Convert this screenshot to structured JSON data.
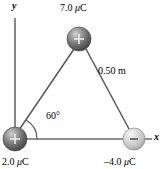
{
  "figure": {
    "type": "physics-diagram",
    "background_color": "#ffffff",
    "line_color": "#58585a",
    "text_color": "#000000"
  },
  "axes": {
    "x_label": "x",
    "y_label": "y"
  },
  "charges": [
    {
      "id": "top",
      "label": "7.0 μC",
      "value": 7.0,
      "unit": "μC",
      "sign": "+",
      "sign_glyph": "+",
      "fill": "#6d6d6d",
      "position": {
        "x": 79,
        "y": 39
      },
      "radius": 12
    },
    {
      "id": "left",
      "label": "2.0 μC",
      "value": 2.0,
      "unit": "μC",
      "sign": "+",
      "sign_glyph": "+",
      "fill": "#6d6d6d",
      "position": {
        "x": 15,
        "y": 139
      },
      "radius": 12
    },
    {
      "id": "right",
      "label": "–4.0 μC",
      "value": -4.0,
      "unit": "μC",
      "sign": "–",
      "sign_glyph": "–",
      "fill": "#c9c9c9",
      "position": {
        "x": 134,
        "y": 139
      },
      "radius": 11
    }
  ],
  "annotations": {
    "side_length": "0.50 m",
    "angle": "60°"
  }
}
